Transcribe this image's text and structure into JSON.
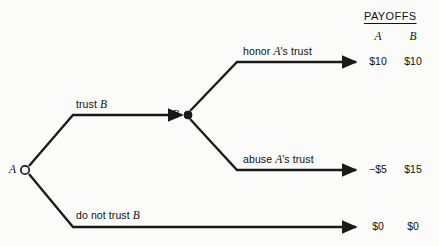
{
  "diagram": {
    "type": "extensive-form-game-tree",
    "nodes": [
      {
        "id": "A",
        "label": "A",
        "kind": "open-circle",
        "player": "A",
        "x": 25,
        "y": 170
      },
      {
        "id": "B",
        "label": "B",
        "kind": "filled-circle",
        "player": "B",
        "x": 188,
        "y": 115
      }
    ],
    "branches": [
      {
        "id": "trust",
        "label_plain": "trust B",
        "label_prefix": "trust ",
        "label_italic": "B",
        "from": "A",
        "to": "B"
      },
      {
        "id": "do-not-trust",
        "label_plain": "do not trust B",
        "label_prefix": "do not trust ",
        "label_italic": "B",
        "from": "A",
        "to": "outcome-3"
      },
      {
        "id": "honor",
        "label_prefix": "honor ",
        "label_italic": "A",
        "label_suffix": "'s trust",
        "from": "B",
        "to": "outcome-1"
      },
      {
        "id": "abuse",
        "label_prefix": "abuse ",
        "label_italic": "A",
        "label_suffix": "'s trust",
        "from": "B",
        "to": "outcome-2"
      }
    ]
  },
  "payoffs": {
    "title": "PAYOFFS",
    "columns": [
      "A",
      "B"
    ],
    "rows": [
      {
        "id": "outcome-1",
        "a": "$10",
        "b": "$10"
      },
      {
        "id": "outcome-2",
        "a": "−$5",
        "b": "$15"
      },
      {
        "id": "outcome-3",
        "a": "$0",
        "b": "$0"
      }
    ]
  },
  "style": {
    "line_color": "#1a1a1a",
    "background": "#fbfbf9"
  }
}
